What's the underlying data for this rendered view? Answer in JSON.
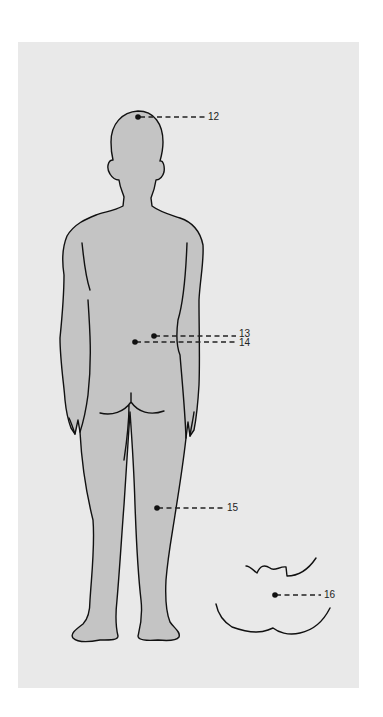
{
  "figure": {
    "background_color": "#e9e9e9",
    "body_fill_color": "#c4c4c4",
    "outline_color": "#111111",
    "points": [
      {
        "id": "12",
        "label": "12",
        "location": "top of head"
      },
      {
        "id": "13",
        "label": "13",
        "location": "lower back, right of spine"
      },
      {
        "id": "14",
        "label": "14",
        "location": "lower back, spine"
      },
      {
        "id": "15",
        "label": "15",
        "location": "back of knee"
      },
      {
        "id": "16",
        "label": "16",
        "location": "mouth inset detail"
      }
    ]
  }
}
